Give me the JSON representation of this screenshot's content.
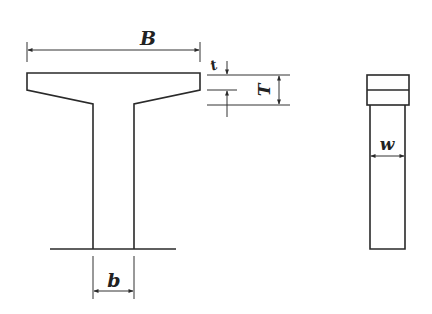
{
  "figure": {
    "colors": {
      "line": "#2a2a2a",
      "background": "#ffffff"
    },
    "labels": {
      "flange_width": "B",
      "flange_thickness": "t",
      "total_depth_top": "T",
      "web_width": "b",
      "side_width": "w"
    }
  }
}
